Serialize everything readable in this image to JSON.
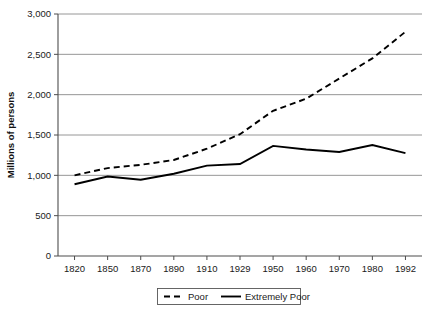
{
  "chart_data": {
    "type": "line",
    "title": "",
    "xlabel": "",
    "ylabel": "Millions of persons",
    "categories": [
      "1820",
      "1850",
      "1870",
      "1890",
      "1910",
      "1929",
      "1950",
      "1960",
      "1970",
      "1980",
      "1992"
    ],
    "series": [
      {
        "name": "Poor",
        "style": "dashed",
        "color": "#000000",
        "values": [
          1000,
          1090,
          1130,
          1190,
          1330,
          1510,
          1800,
          1950,
          2200,
          2450,
          2780
        ]
      },
      {
        "name": "Extremely Poor",
        "style": "solid",
        "color": "#000000",
        "values": [
          890,
          985,
          945,
          1020,
          1120,
          1140,
          1365,
          1320,
          1290,
          1375,
          1275
        ]
      }
    ],
    "ylim": [
      0,
      3000
    ],
    "yticks": [
      0,
      500,
      1000,
      1500,
      2000,
      2500,
      3000
    ],
    "ytick_labels": [
      "0",
      "500",
      "1,000",
      "1,500",
      "2,000",
      "2,500",
      "3,000"
    ],
    "grid": true,
    "grid_axis": "y",
    "legend": {
      "position": "bottom",
      "entries": [
        "Poor",
        "Extremely Poor"
      ]
    }
  }
}
